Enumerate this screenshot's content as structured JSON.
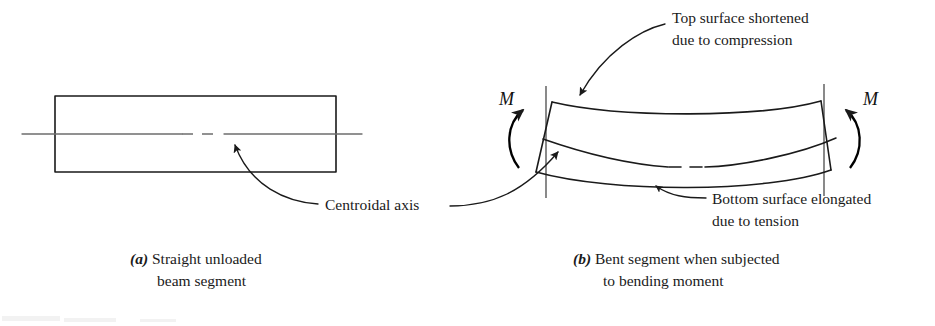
{
  "figure": {
    "background_color": "#ffffff",
    "ink_color": "#1a1a1a",
    "axis_color": "#6d6d6d",
    "width": 935,
    "height": 326
  },
  "panel_a": {
    "caption_tag": "(a)",
    "caption_line1": " Straight unloaded",
    "caption_line2": "beam segment",
    "beam": {
      "label": "straight-beam-rectangle",
      "left": 55,
      "top": 96,
      "right": 336,
      "bottom": 172
    },
    "centroidal_axis": {
      "label": "centroidal-axis-line",
      "y": 134,
      "x_start": 22,
      "x_end": 362,
      "dash_gap_start": 182,
      "dash_gap_end": 222
    }
  },
  "panel_b": {
    "caption_tag": "(b)",
    "caption_line1": " Bent segment when subjected",
    "caption_line2": "to bending moment",
    "moment_left_label": "M",
    "moment_right_label": "M"
  },
  "annotations": {
    "centroidal_axis": {
      "line1": "Centroidal axis"
    },
    "top_surface": {
      "line1": "Top surface shortened",
      "line2": "due to compression"
    },
    "bottom_surface": {
      "line1": "Bottom surface elongated",
      "line2": "due to tension"
    }
  }
}
